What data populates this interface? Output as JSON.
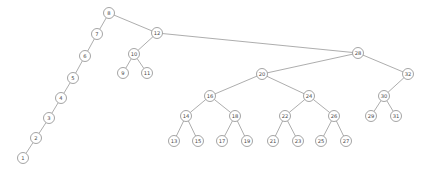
{
  "figure": {
    "type": "node-link-tree",
    "background_color": "#ffffff",
    "node_fill_color": "#ffffff",
    "node_stroke_color": "#7d7d7d",
    "edge_color": "#8a8a8a",
    "label_color": "#4a4a4a",
    "node_radius": 5.5,
    "width": 429,
    "height": 171
  },
  "chart_data": {
    "type": "diagram",
    "title": "",
    "root": "8",
    "node_count": 32,
    "nodes": [
      {
        "id": "1",
        "label": "1",
        "x": 23,
        "y": 158
      },
      {
        "id": "2",
        "label": "2",
        "x": 36,
        "y": 138
      },
      {
        "id": "3",
        "label": "3",
        "x": 49,
        "y": 118
      },
      {
        "id": "4",
        "label": "4",
        "x": 61,
        "y": 98
      },
      {
        "id": "5",
        "label": "5",
        "x": 73,
        "y": 78
      },
      {
        "id": "6",
        "label": "6",
        "x": 85,
        "y": 56
      },
      {
        "id": "7",
        "label": "7",
        "x": 97,
        "y": 34
      },
      {
        "id": "8",
        "label": "8",
        "x": 109,
        "y": 13
      },
      {
        "id": "9",
        "label": "9",
        "x": 123,
        "y": 73
      },
      {
        "id": "10",
        "label": "10",
        "x": 134,
        "y": 54
      },
      {
        "id": "11",
        "label": "11",
        "x": 147,
        "y": 73
      },
      {
        "id": "12",
        "label": "12",
        "x": 157,
        "y": 33
      },
      {
        "id": "13",
        "label": "13",
        "x": 174,
        "y": 141
      },
      {
        "id": "14",
        "label": "14",
        "x": 186,
        "y": 116
      },
      {
        "id": "15",
        "label": "15",
        "x": 198,
        "y": 141
      },
      {
        "id": "16",
        "label": "16",
        "x": 210,
        "y": 96
      },
      {
        "id": "17",
        "label": "17",
        "x": 222,
        "y": 141
      },
      {
        "id": "18",
        "label": "18",
        "x": 235,
        "y": 116
      },
      {
        "id": "19",
        "label": "19",
        "x": 247,
        "y": 141
      },
      {
        "id": "20",
        "label": "20",
        "x": 262,
        "y": 74
      },
      {
        "id": "21",
        "label": "21",
        "x": 273,
        "y": 141
      },
      {
        "id": "22",
        "label": "22",
        "x": 285,
        "y": 116
      },
      {
        "id": "23",
        "label": "23",
        "x": 298,
        "y": 141
      },
      {
        "id": "24",
        "label": "24",
        "x": 309,
        "y": 96
      },
      {
        "id": "25",
        "label": "25",
        "x": 321,
        "y": 141
      },
      {
        "id": "26",
        "label": "26",
        "x": 334,
        "y": 116
      },
      {
        "id": "27",
        "label": "27",
        "x": 346,
        "y": 141
      },
      {
        "id": "28",
        "label": "28",
        "x": 358,
        "y": 53
      },
      {
        "id": "29",
        "label": "29",
        "x": 371,
        "y": 116
      },
      {
        "id": "30",
        "label": "30",
        "x": 384,
        "y": 96
      },
      {
        "id": "31",
        "label": "31",
        "x": 396,
        "y": 116
      },
      {
        "id": "32",
        "label": "32",
        "x": 408,
        "y": 74
      }
    ],
    "edges": [
      {
        "source": "8",
        "target": "7"
      },
      {
        "source": "7",
        "target": "6"
      },
      {
        "source": "6",
        "target": "5"
      },
      {
        "source": "5",
        "target": "4"
      },
      {
        "source": "4",
        "target": "3"
      },
      {
        "source": "3",
        "target": "2"
      },
      {
        "source": "2",
        "target": "1"
      },
      {
        "source": "8",
        "target": "12"
      },
      {
        "source": "12",
        "target": "10"
      },
      {
        "source": "10",
        "target": "9"
      },
      {
        "source": "10",
        "target": "11"
      },
      {
        "source": "12",
        "target": "28"
      },
      {
        "source": "28",
        "target": "20"
      },
      {
        "source": "28",
        "target": "32"
      },
      {
        "source": "20",
        "target": "16"
      },
      {
        "source": "20",
        "target": "24"
      },
      {
        "source": "16",
        "target": "14"
      },
      {
        "source": "16",
        "target": "18"
      },
      {
        "source": "14",
        "target": "13"
      },
      {
        "source": "14",
        "target": "15"
      },
      {
        "source": "18",
        "target": "17"
      },
      {
        "source": "18",
        "target": "19"
      },
      {
        "source": "24",
        "target": "22"
      },
      {
        "source": "24",
        "target": "26"
      },
      {
        "source": "22",
        "target": "21"
      },
      {
        "source": "22",
        "target": "23"
      },
      {
        "source": "26",
        "target": "25"
      },
      {
        "source": "26",
        "target": "27"
      },
      {
        "source": "32",
        "target": "30"
      },
      {
        "source": "30",
        "target": "29"
      },
      {
        "source": "30",
        "target": "31"
      }
    ]
  }
}
